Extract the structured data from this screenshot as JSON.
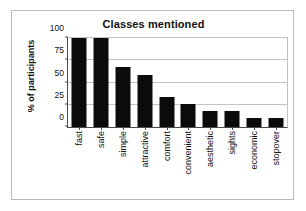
{
  "chart_data": {
    "type": "bar",
    "title": "Classes mentioned",
    "xlabel": "",
    "ylabel": "% of participants",
    "ylim": [
      0,
      100
    ],
    "yticks": [
      0,
      25,
      50,
      75,
      100
    ],
    "ytick_labels": [
      "0",
      "25",
      "50",
      "75",
      "100"
    ],
    "grid": true,
    "legend": false,
    "bar_color": "#0b0b0b",
    "categories": [
      "fast",
      "safe",
      "simple",
      "attractive",
      "comfort",
      "convenient",
      "aesthetic",
      "sights",
      "economic",
      "stopover"
    ],
    "values": [
      100,
      100,
      67,
      59,
      34,
      26,
      18,
      18,
      10,
      10
    ]
  }
}
